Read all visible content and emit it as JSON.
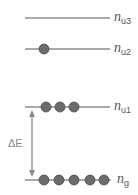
{
  "diagram": {
    "levels": [
      {
        "id": "u3",
        "label_main": "n",
        "label_sub": "u3",
        "y": 18,
        "particles": []
      },
      {
        "id": "u2",
        "label_main": "n",
        "label_sub": "u2",
        "y": 49,
        "particles": [
          44
        ]
      },
      {
        "id": "u1",
        "label_main": "n",
        "label_sub": "u1",
        "y": 107,
        "particles": [
          46,
          60,
          74
        ]
      },
      {
        "id": "g",
        "label_main": "n",
        "label_sub": "g",
        "y": 180,
        "particles": [
          44,
          59,
          74,
          90,
          104
        ]
      }
    ],
    "energy_gap": {
      "label": "ΔE",
      "from": "g",
      "to": "u1"
    },
    "colors": {
      "line": "#555555",
      "particle": "#6b6b6b",
      "particle_edge": "#4a4a4a",
      "arrow": "#8a8a8a"
    }
  }
}
